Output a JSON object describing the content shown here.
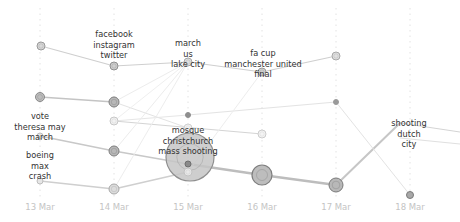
{
  "chart_data": {
    "type": "line",
    "title": "",
    "xlabel": "",
    "ylabel": "",
    "grid": "vertical dotted",
    "categories": [
      "13 Mar",
      "14 Mar",
      "15 Mar",
      "16 Mar",
      "17 Mar",
      "18 Mar"
    ],
    "column_x": [
      40,
      114,
      188,
      262,
      336,
      410
    ],
    "date_label_y": 210,
    "nodes": [
      {
        "id": "a13",
        "x": 41,
        "y": 46,
        "r": 4,
        "fill": "#d8d8d8",
        "stroke": "#9a9a9a"
      },
      {
        "id": "b13",
        "x": 40,
        "y": 97,
        "r": 4.5,
        "fill": "#bdbdbd",
        "stroke": "#8a8a8a"
      },
      {
        "id": "c13",
        "x": 40,
        "y": 136,
        "r": 3,
        "fill": "#e6e6e6",
        "stroke": "#bdbdbd"
      },
      {
        "id": "d13",
        "x": 40,
        "y": 181,
        "r": 3,
        "fill": "#e6e6e6",
        "stroke": "#bdbdbd"
      },
      {
        "id": "a14",
        "x": 114,
        "y": 66,
        "r": 4,
        "fill": "#cfcfcf",
        "stroke": "#8f8f8f"
      },
      {
        "id": "b14",
        "x": 114,
        "y": 102,
        "r": 5,
        "fill": "#b8b8b8",
        "stroke": "#7f7f7f"
      },
      {
        "id": "c14",
        "x": 114,
        "y": 121,
        "r": 4,
        "fill": "#f2f2f2",
        "stroke": "#c8c8c8"
      },
      {
        "id": "d14",
        "x": 114,
        "y": 151,
        "r": 5,
        "fill": "#b8b8b8",
        "stroke": "#7f7f7f"
      },
      {
        "id": "e14",
        "x": 114,
        "y": 189,
        "r": 5,
        "fill": "#dcdcdc",
        "stroke": "#a8a8a8"
      },
      {
        "id": "a15",
        "x": 188,
        "y": 62,
        "r": 4,
        "fill": "#dedede",
        "stroke": "#a8a8a8"
      },
      {
        "id": "b15",
        "x": 188,
        "y": 115,
        "r": 2.5,
        "fill": "#8e8e8e",
        "stroke": "#8e8e8e"
      },
      {
        "id": "c15",
        "x": 188,
        "y": 128,
        "r": 4,
        "fill": "#f2f2f2",
        "stroke": "#d0d0d0"
      },
      {
        "id": "big15",
        "x": 190,
        "y": 157,
        "r": 24,
        "fill": "#c6c6c6",
        "stroke": "#8f8f8f"
      },
      {
        "id": "d15",
        "x": 188,
        "y": 164,
        "r": 3,
        "fill": "#8a8a8a",
        "stroke": "#6e6e6e"
      },
      {
        "id": "e15",
        "x": 188,
        "y": 172,
        "r": 4,
        "fill": "#e8e8e8",
        "stroke": "#c2c2c2"
      },
      {
        "id": "a16",
        "x": 262,
        "y": 72,
        "r": 4,
        "fill": "#d0d0d0",
        "stroke": "#9a9a9a"
      },
      {
        "id": "b16",
        "x": 262,
        "y": 134,
        "r": 4,
        "fill": "#f4f4f4",
        "stroke": "#cccccc"
      },
      {
        "id": "c16",
        "x": 262,
        "y": 175,
        "r": 10,
        "fill": "#bdbdbd",
        "stroke": "#7e7e7e"
      },
      {
        "id": "a17",
        "x": 336,
        "y": 56,
        "r": 4,
        "fill": "#e0e0e0",
        "stroke": "#a8a8a8"
      },
      {
        "id": "b17",
        "x": 336,
        "y": 102,
        "r": 2.5,
        "fill": "#9a9a9a",
        "stroke": "#9a9a9a"
      },
      {
        "id": "c17",
        "x": 336,
        "y": 185,
        "r": 7,
        "fill": "#b8b8b8",
        "stroke": "#7a7a7a"
      },
      {
        "id": "a18",
        "x": 410,
        "y": 195,
        "r": 3.5,
        "fill": "#a8a8a8",
        "stroke": "#7a7a7a"
      }
    ],
    "edges": [
      {
        "from": [
          41,
          46
        ],
        "to": [
          114,
          66
        ],
        "color": "#cfcfcf",
        "w": 1.2
      },
      {
        "from": [
          114,
          66
        ],
        "to": [
          188,
          62
        ],
        "color": "#cfcfcf",
        "w": 1.2
      },
      {
        "from": [
          188,
          62
        ],
        "to": [
          262,
          72
        ],
        "color": "#cfcfcf",
        "w": 1.2
      },
      {
        "from": [
          262,
          72
        ],
        "to": [
          336,
          56
        ],
        "color": "#cfcfcf",
        "w": 1.2
      },
      {
        "from": [
          40,
          97
        ],
        "to": [
          114,
          102
        ],
        "color": "#c4c4c4",
        "w": 1.4
      },
      {
        "from": [
          114,
          102
        ],
        "to": [
          188,
          128
        ],
        "color": "#e3e3e3",
        "w": 1
      },
      {
        "from": [
          114,
          121
        ],
        "to": [
          262,
          134
        ],
        "color": "#d4d4d4",
        "w": 1
      },
      {
        "from": [
          40,
          136
        ],
        "to": [
          114,
          151
        ],
        "color": "#c8c8c8",
        "w": 1.6
      },
      {
        "from": [
          114,
          151
        ],
        "to": [
          188,
          164
        ],
        "color": "#c8c8c8",
        "w": 1.6
      },
      {
        "from": [
          188,
          164
        ],
        "to": [
          262,
          175
        ],
        "color": "#bdbdbd",
        "w": 2.6
      },
      {
        "from": [
          262,
          175
        ],
        "to": [
          336,
          185
        ],
        "color": "#bdbdbd",
        "w": 2.6
      },
      {
        "from": [
          336,
          185
        ],
        "to": [
          400,
          123
        ],
        "color": "#c6c6c6",
        "w": 2
      },
      {
        "from": [
          400,
          123
        ],
        "to": [
          460,
          132
        ],
        "color": "#d4d4d4",
        "w": 1.2
      },
      {
        "from": [
          400,
          138
        ],
        "to": [
          460,
          144
        ],
        "color": "#e0e0e0",
        "w": 1
      },
      {
        "from": [
          40,
          181
        ],
        "to": [
          114,
          189
        ],
        "color": "#cfcfcf",
        "w": 1.6
      },
      {
        "from": [
          114,
          189
        ],
        "to": [
          188,
          172
        ],
        "color": "#cfcfcf",
        "w": 1.6
      },
      {
        "from": [
          188,
          115
        ],
        "to": [
          336,
          102
        ],
        "color": "#e3e3e3",
        "w": 1
      },
      {
        "from": [
          114,
          121
        ],
        "to": [
          188,
          115
        ],
        "color": "#e6e6e6",
        "w": 1
      },
      {
        "from": [
          336,
          102
        ],
        "to": [
          410,
          195
        ],
        "color": "#e3e3e3",
        "w": 1
      },
      {
        "from": [
          114,
          102
        ],
        "to": [
          188,
          62
        ],
        "color": "#ececec",
        "w": 1
      },
      {
        "from": [
          114,
          151
        ],
        "to": [
          188,
          62
        ],
        "color": "#ececec",
        "w": 1
      },
      {
        "from": [
          114,
          189
        ],
        "to": [
          188,
          62
        ],
        "color": "#ededed",
        "w": 1
      },
      {
        "from": [
          188,
          172
        ],
        "to": [
          262,
          72
        ],
        "color": "#ededed",
        "w": 1
      },
      {
        "from": [
          114,
          121
        ],
        "to": [
          188,
          62
        ],
        "color": "#efefef",
        "w": 1
      }
    ],
    "annotations": [
      {
        "lines": [
          "facebook",
          "instagram",
          "twitter"
        ],
        "x": 114,
        "y": 37
      },
      {
        "lines": [
          "march",
          "us",
          "lake city"
        ],
        "x": 188,
        "y": 46
      },
      {
        "lines": [
          "fa cup",
          "manchester united",
          "final"
        ],
        "x": 263,
        "y": 56
      },
      {
        "lines": [
          "vote",
          "theresa may",
          "march"
        ],
        "x": 40,
        "y": 119
      },
      {
        "lines": [
          "boeing",
          "max",
          "crash"
        ],
        "x": 40,
        "y": 158
      },
      {
        "lines": [
          "mosque",
          "christchurch",
          "mass shooting"
        ],
        "x": 188,
        "y": 133
      },
      {
        "lines": [
          "shooting",
          "dutch",
          "city"
        ],
        "x": 409,
        "y": 126
      }
    ]
  }
}
